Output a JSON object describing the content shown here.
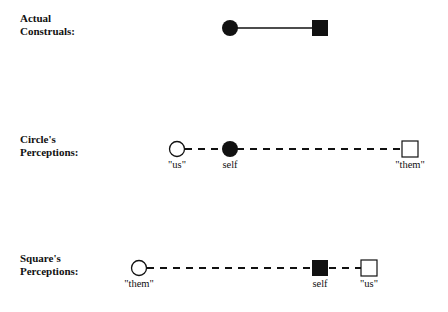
{
  "rows": [
    {
      "id": "actual",
      "label_line1": "Actual",
      "label_line2": "Construals:",
      "line_style": "solid",
      "nodes": [
        {
          "shape": "circle",
          "fill": "filled",
          "x": 230,
          "label": ""
        },
        {
          "shape": "square",
          "fill": "filled",
          "x": 320,
          "label": ""
        }
      ]
    },
    {
      "id": "circle-perceptions",
      "label_line1": "Circle's",
      "label_line2": "Perceptions:",
      "line_style": "dashed",
      "nodes": [
        {
          "shape": "circle",
          "fill": "open",
          "x": 177,
          "label": "\"us\""
        },
        {
          "shape": "circle",
          "fill": "filled",
          "x": 230,
          "label": "self"
        },
        {
          "shape": "square",
          "fill": "open",
          "x": 410,
          "label": "\"them\""
        }
      ]
    },
    {
      "id": "square-perceptions",
      "label_line1": "Square's",
      "label_line2": "Perceptions:",
      "line_style": "dashed",
      "nodes": [
        {
          "shape": "circle",
          "fill": "open",
          "x": 139,
          "label": "\"them\""
        },
        {
          "shape": "square",
          "fill": "filled",
          "x": 320,
          "label": "self"
        },
        {
          "shape": "square",
          "fill": "open",
          "x": 369,
          "label": "\"us\""
        }
      ]
    }
  ],
  "colors": {
    "ink": "#111111",
    "background": "#ffffff"
  }
}
